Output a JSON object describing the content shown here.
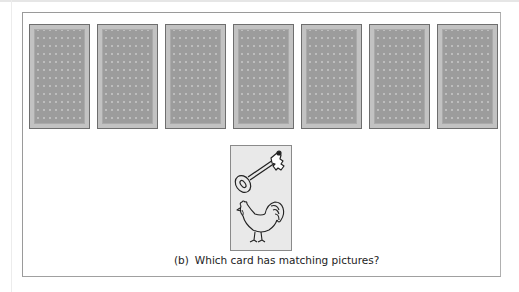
{
  "cards": {
    "face_down_count": 7,
    "face_down": [
      {
        "id": 1,
        "state": "face-down"
      },
      {
        "id": 2,
        "state": "face-down"
      },
      {
        "id": 3,
        "state": "face-down"
      },
      {
        "id": 4,
        "state": "face-down"
      },
      {
        "id": 5,
        "state": "face-down"
      },
      {
        "id": 6,
        "state": "face-down"
      },
      {
        "id": 7,
        "state": "face-down"
      }
    ],
    "target_card": {
      "pictures": [
        "key-icon",
        "rooster-icon"
      ]
    }
  },
  "caption": {
    "label": "(b)",
    "text": "Which card has matching pictures?"
  },
  "colors": {
    "card_back_light": "#bdbdbd",
    "card_back_diamond": "#9c9c9c",
    "card_outline": "#6e6e6e",
    "target_bg": "#e9e9e9",
    "frame_border": "#9a9a9a"
  }
}
